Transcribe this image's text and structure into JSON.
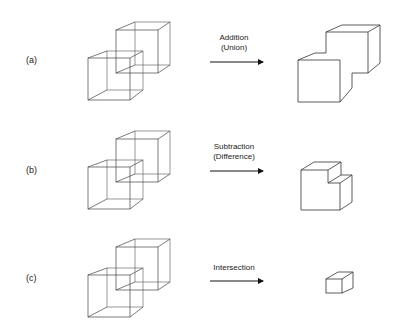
{
  "rows": [
    {
      "label": "(a)",
      "operation": [
        "Addition",
        "(Union)"
      ]
    },
    {
      "label": "(b)",
      "operation": [
        "Subtraction",
        "(Difference)"
      ]
    },
    {
      "label": "(c)",
      "operation": [
        "Intersection"
      ]
    }
  ],
  "colors": {
    "line": "#333333",
    "background": "#ffffff"
  }
}
